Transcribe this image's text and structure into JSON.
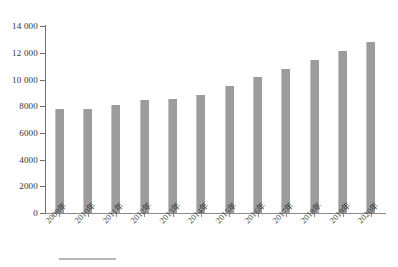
{
  "chart_data": {
    "type": "bar",
    "title": "",
    "subtitle": "",
    "xlabel": "",
    "ylabel": "",
    "categories": [
      "2009年",
      "2010年",
      "2011年",
      "2012年",
      "2013年",
      "2014年",
      "2015年",
      "2016年",
      "2017年",
      "2018年",
      "2019年",
      "2020年"
    ],
    "values": [
      7750,
      7800,
      8100,
      8450,
      8500,
      8850,
      9500,
      10200,
      10800,
      11450,
      12100,
      12800
    ],
    "series": [
      {
        "name": "",
        "values": [
          7750,
          7800,
          8100,
          8450,
          8500,
          8850,
          9500,
          10200,
          10800,
          11450,
          12100,
          12800
        ]
      }
    ],
    "ylim": [
      0,
      14000
    ],
    "ytick_values": [
      0,
      2000,
      4000,
      6000,
      8000,
      10000,
      12000,
      14000
    ],
    "ytick_labels": [
      "0",
      "2000",
      "4000",
      "6000",
      "8000",
      "10 000",
      "12 000",
      "14 000"
    ],
    "grid": false,
    "legend": "none",
    "bar_color": "#9c9c9c",
    "axis_color": "#6f6f6f",
    "background": "#ffffff"
  }
}
